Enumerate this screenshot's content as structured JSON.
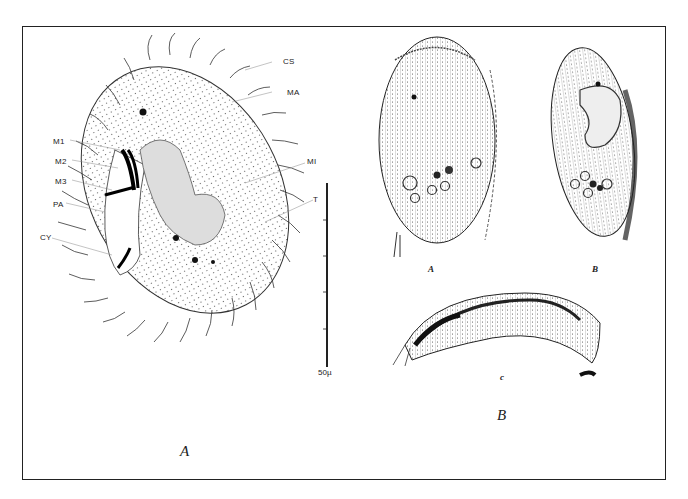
{
  "figure": {
    "panel_a_label": "A",
    "panel_b_label": "B",
    "sub_panels": {
      "a": "A",
      "b": "B",
      "c": "c"
    },
    "labels_left": [
      "M1",
      "M2",
      "M3",
      "PA",
      "CY"
    ],
    "labels_right": [
      "CS",
      "MA",
      "MI",
      "T"
    ],
    "scale_bar": {
      "label": "50µ",
      "value": 50,
      "unit": "µm"
    }
  }
}
